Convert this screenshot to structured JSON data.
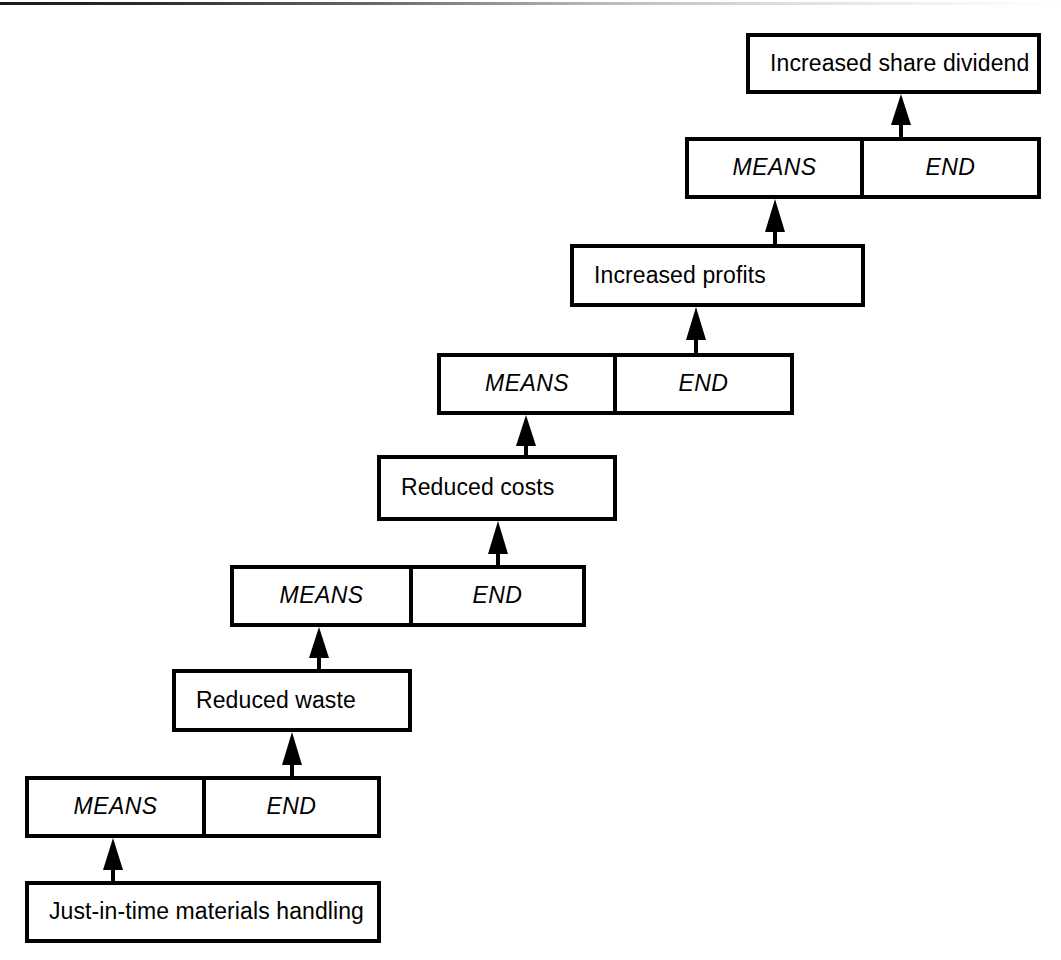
{
  "diagram": {
    "type": "means-end-ladder",
    "orientation": "ascending-left-to-right",
    "line_color": "#000000",
    "background_color": "#ffffff",
    "split_labels": {
      "means": "MEANS",
      "end": "END"
    },
    "levels": [
      {
        "index": 1,
        "outcome": "Just-in-time materials handling",
        "split_means": "MEANS",
        "split_end": "END"
      },
      {
        "index": 2,
        "outcome": "Reduced waste",
        "split_means": "MEANS",
        "split_end": "END"
      },
      {
        "index": 3,
        "outcome": "Reduced costs",
        "split_means": "MEANS",
        "split_end": "END"
      },
      {
        "index": 4,
        "outcome": "Increased profits",
        "split_means": "MEANS",
        "split_end": "END"
      },
      {
        "index": 5,
        "outcome": "Increased share dividend"
      }
    ]
  },
  "nodes": {
    "jit": "Just-in-time materials handling",
    "split1_means": "MEANS",
    "split1_end": "END",
    "waste": "Reduced waste",
    "split2_means": "MEANS",
    "split2_end": "END",
    "costs": "Reduced costs",
    "split3_means": "MEANS",
    "split3_end": "END",
    "profits": "Increased profits",
    "split4_means": "MEANS",
    "split4_end": "END",
    "dividend": "Increased share dividend"
  }
}
